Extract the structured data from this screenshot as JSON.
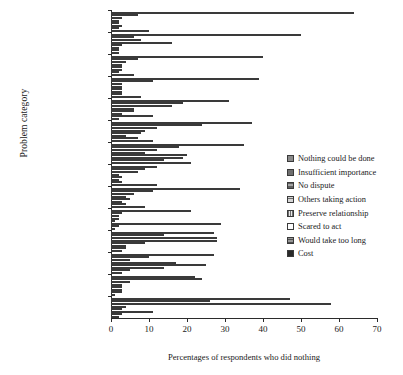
{
  "chart_data": {
    "type": "bar",
    "orientation": "horizontal",
    "title": "",
    "xlabel": "Percentages of respondents who did nothing",
    "ylabel": "Problem category",
    "xlim": [
      0,
      70
    ],
    "xticks": [
      0,
      10,
      20,
      30,
      40,
      50,
      60,
      70
    ],
    "grid": false,
    "legend_position": "right",
    "categories": [
      "Mental health",
      "Discrimination",
      "Housing (rent)",
      "Welfare benefits",
      "Employment",
      "Clinical negligence",
      "Relat. breakdown",
      "Money / Debt",
      "Consumer",
      "Domestic violence",
      "Police treatment",
      "Neighbours",
      "Personal injury",
      "Divorce"
    ],
    "series": [
      {
        "name": "Nothing could be done",
        "color": "#8a8a8a",
        "values": [
          64,
          50,
          40,
          39,
          31,
          37,
          35,
          12,
          34,
          21,
          27,
          27,
          22,
          47
        ]
      },
      {
        "name": "Insufficient importance",
        "color": "#6e6e6e",
        "values": [
          7,
          6,
          7,
          11,
          19,
          24,
          18,
          9,
          11,
          3,
          14,
          10,
          24,
          26
        ]
      },
      {
        "name": "No dispute",
        "color": "#a3a3a3",
        "values": [
          3,
          8,
          4,
          3,
          16,
          12,
          12,
          7,
          6,
          2,
          28,
          5,
          5,
          58
        ]
      },
      {
        "name": "Others taking action",
        "color": "#d6d6d6",
        "values": [
          2,
          16,
          3,
          3,
          6,
          9,
          9,
          2,
          4,
          2,
          28,
          17,
          3,
          4
        ]
      },
      {
        "name": "Preserve relationship",
        "color": "#e8e8e8",
        "values": [
          2,
          3,
          3,
          3,
          6,
          8,
          20,
          3,
          5,
          1,
          9,
          25,
          3,
          3
        ]
      },
      {
        "name": "Scared to act",
        "color": "#fdfdfd",
        "values": [
          3,
          2,
          3,
          3,
          3,
          4,
          19,
          2,
          3,
          29,
          4,
          14,
          3,
          11
        ]
      },
      {
        "name": "Would take too long",
        "color": "#979797",
        "values": [
          2,
          2,
          2,
          3,
          11,
          7,
          14,
          3,
          4,
          2,
          4,
          5,
          3,
          3
        ]
      },
      {
        "name": "Cost",
        "color": "#2a2a2a",
        "values": [
          10,
          2,
          6,
          8,
          2,
          11,
          21,
          12,
          9,
          1,
          3,
          3,
          1,
          2
        ]
      }
    ]
  }
}
